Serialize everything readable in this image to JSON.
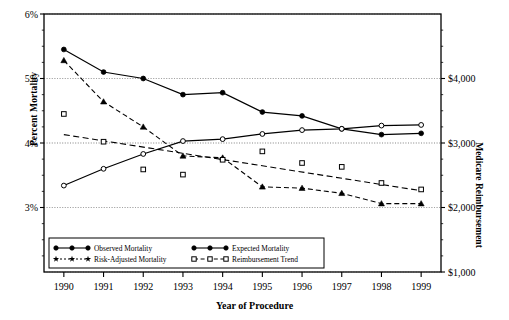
{
  "chart_data": {
    "type": "line",
    "title": "",
    "xlabel": "Year of Procedure",
    "ylabel": "Percent Mortality",
    "ylabel_right": "Medicare Reimbursement",
    "categories": [
      1990,
      1991,
      1992,
      1993,
      1994,
      1995,
      1996,
      1997,
      1998,
      1999
    ],
    "xticklabels": [
      "1990",
      "1991",
      "1992",
      "1993",
      "1994",
      "1995",
      "1996",
      "1997",
      "1998",
      "1999"
    ],
    "ylim": [
      2.0,
      6.0
    ],
    "yticks": [
      3,
      4,
      5,
      6
    ],
    "yticklabels": [
      "3%",
      "4%",
      "5%",
      "6%"
    ],
    "ylim_right": [
      1000,
      5000
    ],
    "yticks_right": [
      1000,
      2000,
      3000,
      4000
    ],
    "yticklabels_right": [
      "$1,000",
      "$2,000",
      "$3,000",
      "$4,000"
    ],
    "grid": true,
    "legend_position": "lower-left-inside",
    "series": [
      {
        "name": "Observed Mortality",
        "marker": "filled-circle",
        "line": "solid",
        "axis": "left",
        "values": [
          5.45,
          5.1,
          5.0,
          4.75,
          4.78,
          4.48,
          4.42,
          4.22,
          4.13,
          4.15
        ]
      },
      {
        "name": "Expected Mortality",
        "marker": "open-circle",
        "line": "solid",
        "axis": "left",
        "values": [
          3.34,
          3.6,
          3.83,
          4.03,
          4.06,
          4.14,
          4.2,
          4.22,
          4.27,
          4.28
        ]
      },
      {
        "name": "Risk-Adjusted Mortality",
        "marker": "filled-triangle",
        "line": "dashed",
        "axis": "left",
        "values": [
          5.28,
          4.64,
          4.25,
          3.8,
          3.77,
          3.32,
          3.3,
          3.22,
          3.06,
          3.06
        ]
      },
      {
        "name": "Reimbursement Trend",
        "marker": "open-square",
        "line": "dashed-scatter",
        "axis": "right",
        "values": [
          3450,
          3020,
          2590,
          2510,
          2740,
          2870,
          2690,
          2630,
          2380,
          2280
        ],
        "trend_start": 3130,
        "trend_end": 2260
      }
    ]
  },
  "legend": {
    "items": [
      {
        "label": "Observed Mortality",
        "marker": "filled-circle",
        "line": "solid"
      },
      {
        "label": "Expected Mortality",
        "marker": "filled-circle",
        "line": "solid"
      },
      {
        "label": "Risk-Adjusted Mortality",
        "marker": "filled-star",
        "line": "dotted"
      },
      {
        "label": "Reimbursement Trend",
        "marker": "open-square",
        "line": "dashed"
      }
    ]
  },
  "colors": {
    "ink": "#000000",
    "grid": "#9a9a9a",
    "background": "#ffffff"
  }
}
